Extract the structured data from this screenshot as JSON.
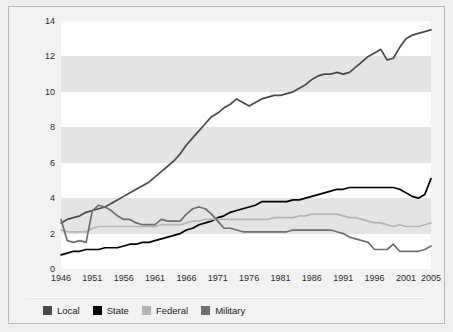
{
  "chart_data": {
    "type": "line",
    "title": "",
    "xlabel": "",
    "ylabel": "Number of Employees (millions)",
    "xlim": [
      1946,
      2005
    ],
    "ylim": [
      0,
      14
    ],
    "yticks": [
      0,
      2,
      4,
      6,
      8,
      10,
      12,
      14
    ],
    "xticks": [
      1946,
      1951,
      1956,
      1961,
      1966,
      1971,
      1976,
      1981,
      1986,
      1991,
      1996,
      2001,
      2005
    ],
    "grid": false,
    "banded_background": true,
    "legend_position": "bottom",
    "x": [
      1946,
      1947,
      1948,
      1949,
      1950,
      1951,
      1952,
      1953,
      1954,
      1955,
      1956,
      1957,
      1958,
      1959,
      1960,
      1961,
      1962,
      1963,
      1964,
      1965,
      1966,
      1967,
      1968,
      1969,
      1970,
      1971,
      1972,
      1973,
      1974,
      1975,
      1976,
      1977,
      1978,
      1979,
      1980,
      1981,
      1982,
      1983,
      1984,
      1985,
      1986,
      1987,
      1988,
      1989,
      1990,
      1991,
      1992,
      1993,
      1994,
      1995,
      1996,
      1997,
      1998,
      1999,
      2000,
      2001,
      2002,
      2003,
      2004,
      2005
    ],
    "series": [
      {
        "name": "Local",
        "color": "#4a4a4a",
        "values": [
          2.6,
          2.8,
          2.9,
          3.0,
          3.2,
          3.3,
          3.4,
          3.5,
          3.7,
          3.9,
          4.1,
          4.3,
          4.5,
          4.7,
          4.9,
          5.2,
          5.5,
          5.8,
          6.1,
          6.5,
          7.0,
          7.4,
          7.8,
          8.2,
          8.6,
          8.8,
          9.1,
          9.3,
          9.6,
          9.4,
          9.2,
          9.4,
          9.6,
          9.7,
          9.8,
          9.8,
          9.9,
          10.0,
          10.2,
          10.4,
          10.7,
          10.9,
          11.0,
          11.0,
          11.1,
          11.0,
          11.1,
          11.4,
          11.7,
          12.0,
          12.2,
          12.4,
          11.8,
          11.9,
          12.5,
          13.0,
          13.2,
          13.3,
          13.4,
          13.5
        ]
      },
      {
        "name": "State",
        "color": "#000000",
        "values": [
          0.8,
          0.9,
          1.0,
          1.0,
          1.1,
          1.1,
          1.1,
          1.2,
          1.2,
          1.2,
          1.3,
          1.4,
          1.4,
          1.5,
          1.5,
          1.6,
          1.7,
          1.8,
          1.9,
          2.0,
          2.2,
          2.3,
          2.5,
          2.6,
          2.7,
          2.9,
          3.0,
          3.2,
          3.3,
          3.4,
          3.5,
          3.6,
          3.8,
          3.8,
          3.8,
          3.8,
          3.8,
          3.9,
          3.9,
          4.0,
          4.1,
          4.2,
          4.3,
          4.4,
          4.5,
          4.5,
          4.6,
          4.6,
          4.6,
          4.6,
          4.6,
          4.6,
          4.6,
          4.6,
          4.5,
          4.3,
          4.1,
          4.0,
          4.2,
          5.1
        ]
      },
      {
        "name": "Federal",
        "color": "#b4b4b4",
        "values": [
          2.2,
          2.1,
          2.1,
          2.1,
          2.1,
          2.3,
          2.4,
          2.4,
          2.4,
          2.4,
          2.4,
          2.4,
          2.4,
          2.4,
          2.4,
          2.4,
          2.5,
          2.5,
          2.5,
          2.5,
          2.6,
          2.7,
          2.7,
          2.8,
          2.8,
          2.8,
          2.8,
          2.8,
          2.8,
          2.8,
          2.8,
          2.8,
          2.8,
          2.8,
          2.9,
          2.9,
          2.9,
          2.9,
          3.0,
          3.0,
          3.1,
          3.1,
          3.1,
          3.1,
          3.1,
          3.0,
          2.9,
          2.9,
          2.8,
          2.7,
          2.6,
          2.6,
          2.5,
          2.4,
          2.5,
          2.4,
          2.4,
          2.4,
          2.5,
          2.6
        ]
      },
      {
        "name": "Military",
        "color": "#6e6e6e",
        "values": [
          2.8,
          1.6,
          1.5,
          1.6,
          1.5,
          3.3,
          3.6,
          3.5,
          3.3,
          3.0,
          2.8,
          2.8,
          2.6,
          2.5,
          2.5,
          2.5,
          2.8,
          2.7,
          2.7,
          2.7,
          3.1,
          3.4,
          3.5,
          3.4,
          3.1,
          2.7,
          2.3,
          2.3,
          2.2,
          2.1,
          2.1,
          2.1,
          2.1,
          2.1,
          2.1,
          2.1,
          2.1,
          2.2,
          2.2,
          2.2,
          2.2,
          2.2,
          2.2,
          2.2,
          2.1,
          2.0,
          1.8,
          1.7,
          1.6,
          1.5,
          1.1,
          1.1,
          1.1,
          1.4,
          1.0,
          1.0,
          1.0,
          1.0,
          1.1,
          1.3
        ]
      }
    ]
  },
  "legend": {
    "items": [
      {
        "label": "Local",
        "color": "#4a4a4a"
      },
      {
        "label": "State",
        "color": "#000000"
      },
      {
        "label": "Federal",
        "color": "#b4b4b4"
      },
      {
        "label": "Military",
        "color": "#6e6e6e"
      }
    ]
  },
  "colors": {
    "figure_background": "#f2f2f2",
    "page_background": "#efefef",
    "band_grey": "#e4e4e4",
    "band_white": "#ffffff",
    "border": "#b9b9b9",
    "tick_text": "#2b2b2b"
  }
}
